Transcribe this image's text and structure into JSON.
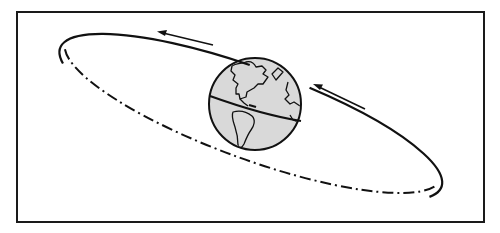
{
  "figure": {
    "title": "Orbit around Earth",
    "colors": {
      "line": "#111111",
      "globe_fill": "#d9d9d9",
      "background": "#ffffff",
      "frame": "#1a1a1a"
    },
    "frame": {
      "x": 17,
      "y": 12,
      "width": 467,
      "height": 210
    },
    "globe": {
      "cx": 255,
      "cy": 104,
      "r": 46,
      "label": "Earth"
    },
    "orbit": {
      "cx": 251,
      "cy": 117,
      "rx": 200,
      "ry": 49,
      "rotation_deg": 20,
      "upper_style": "solid",
      "lower_style": "dash-dot"
    },
    "arrows": [
      {
        "name": "upper-left-arrow",
        "from": [
          213,
          45
        ],
        "to": [
          158,
          32
        ],
        "direction": "left"
      },
      {
        "name": "upper-right-arrow",
        "from": [
          365,
          109
        ],
        "to": [
          314,
          85
        ],
        "direction": "up-left"
      }
    ]
  }
}
